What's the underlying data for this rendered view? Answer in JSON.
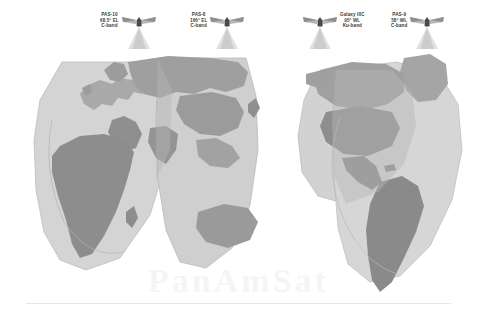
{
  "map": {
    "title": "Global Satellite Coverage Map",
    "description": "Grayscale world map showing overlapping satellite beam footprints",
    "background_color": "#ffffff",
    "colors": {
      "ocean": "#ffffff",
      "land_light": "#c9c9c9",
      "land_medium": "#a8a8a8",
      "land_dark": "#8e8e8e",
      "beam_light": "#d6d6d6",
      "beam_medium": "#bdbdbd",
      "outline": "#9a9a9a",
      "label_text": "#3d3d3d",
      "watermark": "#f0f0f0"
    },
    "watermark_text": "PanAmSat"
  },
  "satellites": [
    {
      "name": "PAS-10",
      "position": "68.5° EL",
      "band": "C-band",
      "icon": "satellite-icon",
      "label_x": 104,
      "label_y": 10,
      "icon_side": "right"
    },
    {
      "name": "PAS-8",
      "position": "166° EL",
      "band": "C-band",
      "icon": "satellite-icon",
      "label_x": 192,
      "label_y": 10,
      "icon_side": "right"
    },
    {
      "name": "Galaxy IIIC",
      "position": "95° WL",
      "band": "Ku-band",
      "icon": "satellite-icon",
      "label_x": 300,
      "label_y": 10,
      "icon_side": "left"
    },
    {
      "name": "PAS-9",
      "position": "58° WL",
      "band": "C-band",
      "icon": "satellite-icon",
      "label_x": 393,
      "label_y": 10,
      "icon_side": "right"
    }
  ]
}
